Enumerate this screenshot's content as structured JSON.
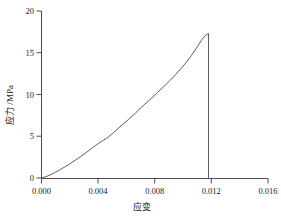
{
  "chart_data": {
    "type": "line",
    "title": "",
    "xlabel": "应变",
    "ylabel": "应力 /MPa",
    "xlim": [
      0.0,
      0.016
    ],
    "ylim": [
      0,
      20
    ],
    "grid": false,
    "legend": null,
    "xticks": [
      "0.000",
      "0.004",
      "0.008",
      "0.012",
      "0.016"
    ],
    "xtick_values": [
      0.0,
      0.004,
      0.008,
      0.012,
      0.016
    ],
    "yticks": [
      "0",
      "5",
      "10",
      "15",
      "20"
    ],
    "ytick_values": [
      0,
      5,
      10,
      15,
      20
    ],
    "series": [
      {
        "name": "stress-strain",
        "x": [
          0.0,
          0.0002,
          0.0004,
          0.0006,
          0.0008,
          0.001,
          0.0012,
          0.0014,
          0.0016,
          0.0018,
          0.002,
          0.0024,
          0.0028,
          0.0032,
          0.0036,
          0.004,
          0.0044,
          0.0046,
          0.005,
          0.0054,
          0.0058,
          0.0062,
          0.0066,
          0.007,
          0.0074,
          0.0078,
          0.0082,
          0.0086,
          0.009,
          0.0094,
          0.0098,
          0.0102,
          0.0106,
          0.011,
          0.0113,
          0.0116,
          0.0118,
          0.0118
        ],
        "y": [
          0.0,
          0.1,
          0.22,
          0.36,
          0.52,
          0.7,
          0.88,
          1.08,
          1.28,
          1.48,
          1.7,
          2.15,
          2.62,
          3.1,
          3.62,
          4.12,
          4.55,
          4.75,
          5.3,
          5.9,
          6.5,
          7.1,
          7.7,
          8.4,
          9.0,
          9.6,
          10.25,
          10.9,
          11.55,
          12.25,
          13.0,
          13.8,
          14.7,
          15.7,
          16.5,
          17.1,
          17.3,
          0.0
        ]
      }
    ],
    "annotations": {
      "peak_stress": 17.3,
      "peak_strain": 0.0118,
      "failure_drop": "vertical drop to 0 at peak strain"
    },
    "colors": {
      "curve": "#4a4a4a",
      "axis": "#3a3a3a",
      "text": "#222222",
      "background": "#ffffff"
    }
  }
}
